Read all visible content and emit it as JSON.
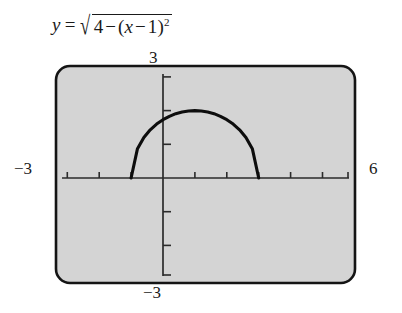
{
  "equation": {
    "lhs": "y",
    "equals": "=",
    "radical_sign": "√",
    "radicand_main": "4",
    "radicand_minus": "−",
    "radicand_open": "(",
    "radicand_var": "x",
    "radicand_minus2": "−",
    "radicand_one": "1",
    "radicand_close": ")",
    "radicand_exponent": "2",
    "plain": "y = √(4 − (x − 1)²)"
  },
  "viewport_labels": {
    "top": "3",
    "bottom": "−3",
    "left": "−3",
    "right": "6"
  },
  "colors": {
    "screen_fill": "#d0d0d0",
    "screen_border": "#141414",
    "curve": "#0d0d0d",
    "axis": "#2b2b2b",
    "text": "#1a1a1a",
    "page": "#ffffff"
  },
  "chart_data": {
    "type": "line",
    "xlabel": "",
    "ylabel": "",
    "xlim": [
      -3,
      6
    ],
    "ylim": [
      -3,
      3
    ],
    "xticks": [
      -3,
      -2,
      -1,
      0,
      1,
      2,
      3,
      4,
      5,
      6
    ],
    "yticks": [
      -3,
      -2,
      -1,
      0,
      1,
      2,
      3
    ],
    "grid": false,
    "legend": "none",
    "series": [
      {
        "name": "y = sqrt(4 - (x-1)^2)",
        "x": [
          -1,
          -0.8,
          -0.6,
          -0.4,
          -0.2,
          0,
          0.2,
          0.4,
          0.6,
          0.8,
          1,
          1.2,
          1.4,
          1.6,
          1.8,
          2,
          2.2,
          2.4,
          2.6,
          2.8,
          3
        ],
        "y": [
          0,
          0.87,
          1.2,
          1.43,
          1.6,
          1.73,
          1.83,
          1.91,
          1.96,
          1.99,
          2,
          1.99,
          1.96,
          1.91,
          1.83,
          1.73,
          1.6,
          1.43,
          1.2,
          0.87,
          0
        ]
      }
    ],
    "annotations": {
      "center": [
        1,
        0
      ],
      "radius": 2,
      "domain": [
        -1,
        3
      ],
      "range": [
        0,
        2
      ]
    }
  }
}
